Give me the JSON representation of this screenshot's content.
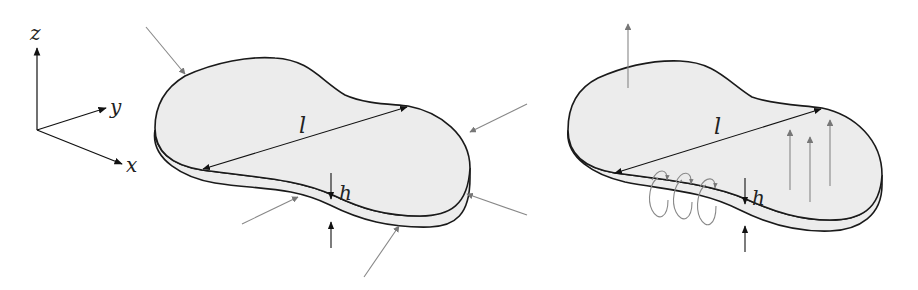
{
  "axes": {
    "z": "z",
    "y": "y",
    "x": "x"
  },
  "left_plate": {
    "length_label": "l",
    "thickness_label": "h",
    "force_arrows": 6,
    "description": "in-plane compressive loads"
  },
  "right_plate": {
    "length_label": "l",
    "thickness_label": "h",
    "normal_arrows": 4,
    "moment_loops": 3,
    "description": "out-of-plane loads and moments"
  },
  "colors": {
    "plate_fill": "#ececec",
    "outline": "#1a1a1a",
    "load_arrow": "#6e6e6e",
    "dimension": "#111111"
  }
}
